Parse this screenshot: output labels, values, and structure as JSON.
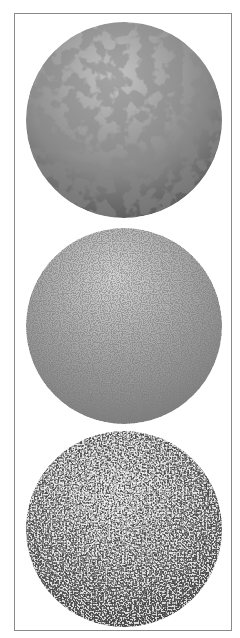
{
  "figure": {
    "frame_color": "#8a8a8a",
    "spheres": [
      {
        "id": "sphere-1",
        "texture": "cloudy-blotch-noise",
        "light_color": "#b4b4b4",
        "dark_color": "#555555"
      },
      {
        "id": "sphere-2",
        "texture": "fine-grain-noise",
        "light_color": "#c8c8c8",
        "dark_color": "#6a6a6a"
      },
      {
        "id": "sphere-3",
        "texture": "coarse-speckle-noise",
        "light_color": "#e0e0e0",
        "dark_color": "#202020"
      }
    ]
  }
}
